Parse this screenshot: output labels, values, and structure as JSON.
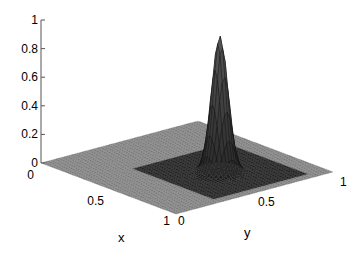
{
  "chart_data": {
    "type": "surface3d",
    "title": "",
    "xlabel": "x",
    "ylabel": "y",
    "zlabel": "",
    "xlim": [
      0,
      1
    ],
    "ylim": [
      0,
      1
    ],
    "zlim": [
      0,
      1
    ],
    "x_ticks": [
      "0",
      "0.5",
      "1"
    ],
    "y_ticks": [
      "0",
      "0.5",
      "1"
    ],
    "z_ticks": [
      "0",
      "0.2",
      "0.4",
      "0.6",
      "0.8",
      "1"
    ],
    "grid": false,
    "colormap": "gray",
    "peak": {
      "x": 0.65,
      "y": 0.58,
      "z": 0.95,
      "width_sigma": 0.04
    }
  },
  "axes": {
    "x_label": "x",
    "y_label": "y",
    "z_tick_labels": [
      "0",
      "0.2",
      "0.4",
      "0.6",
      "0.8",
      "1"
    ],
    "x_tick_labels": [
      "0",
      "0.5",
      "1"
    ],
    "y_tick_labels": [
      "0",
      "0.5",
      "1"
    ]
  }
}
